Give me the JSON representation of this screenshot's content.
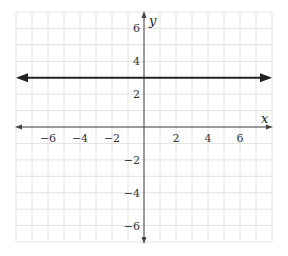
{
  "chart_data": {
    "type": "line",
    "title": "",
    "xlabel": "x",
    "ylabel": "y",
    "xlim": [
      -8,
      8
    ],
    "ylim": [
      -7,
      7
    ],
    "grid": true,
    "x_ticks": [
      -6,
      -4,
      -2,
      2,
      4,
      6
    ],
    "y_ticks": [
      6,
      4,
      2,
      -2,
      -4,
      -6
    ],
    "x_tick_labels": [
      "−6",
      "−4",
      "−2",
      "2",
      "4",
      "6"
    ],
    "y_tick_labels": [
      "6",
      "4",
      "2",
      "−2",
      "−4",
      "−6"
    ],
    "series": [
      {
        "name": "y = 3",
        "equation": "y = 3",
        "x": [
          -8,
          8
        ],
        "y": [
          3,
          3
        ],
        "arrows": "both"
      }
    ]
  }
}
